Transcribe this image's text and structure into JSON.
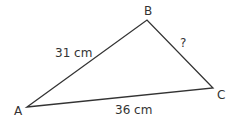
{
  "diagram": {
    "type": "triangle",
    "stroke_color": "#333333",
    "text_color": "#333333",
    "vertices": [
      {
        "name": "A",
        "x": 27,
        "y": 107,
        "label_x": 14,
        "label_y": 115
      },
      {
        "name": "B",
        "x": 147,
        "y": 20,
        "label_x": 144,
        "label_y": 15
      },
      {
        "name": "C",
        "x": 213,
        "y": 88,
        "label_x": 217,
        "label_y": 99
      }
    ],
    "sides": [
      {
        "from": "A",
        "to": "B",
        "label": "31 cm",
        "label_x": 55,
        "label_y": 57
      },
      {
        "from": "B",
        "to": "C",
        "label": "?",
        "label_x": 180,
        "label_y": 47
      },
      {
        "from": "A",
        "to": "C",
        "label": "36 cm",
        "label_x": 115,
        "label_y": 114
      }
    ]
  }
}
